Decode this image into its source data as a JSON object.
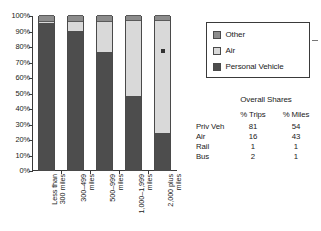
{
  "chart_data": {
    "type": "bar",
    "subtype": "stacked-bar-100-percent",
    "title": "",
    "xlabel": "",
    "ylabel": "",
    "ylim": [
      0,
      100
    ],
    "ytick_labels": [
      "100%",
      "90%",
      "80%",
      "70%",
      "60%",
      "50%",
      "40%",
      "30%",
      "20%",
      "10%",
      "0%"
    ],
    "ytick_values": [
      100,
      90,
      80,
      70,
      60,
      50,
      40,
      30,
      20,
      10,
      0
    ],
    "grid": false,
    "legend_position": "right",
    "categories": [
      "Less than\n300 miles",
      "300–499\nmiles",
      "500–999\nmiles",
      "1,000–1,999\nmiles",
      "2,000 plus\nmiles"
    ],
    "series": [
      {
        "name": "Personal Vehicle",
        "color": "#4d4d4d",
        "values": [
          95,
          90,
          76,
          48,
          24
        ]
      },
      {
        "name": "Air",
        "color": "#d9d9d9",
        "values": [
          1,
          6,
          20,
          49,
          73
        ]
      },
      {
        "name": "Other",
        "color": "#8c8c8c",
        "values": [
          4,
          4,
          4,
          3,
          3
        ]
      }
    ],
    "annotations": [
      {
        "name": "data-marker",
        "category": "2,000 plus miles",
        "value": 77
      }
    ]
  },
  "legend": {
    "items": [
      {
        "label": "Other",
        "color": "#8c8c8c"
      },
      {
        "label": "Air",
        "color": "#d9d9d9"
      },
      {
        "label": "Personal Vehicle",
        "color": "#4d4d4d"
      }
    ]
  },
  "shares": {
    "title": "Overall Shares",
    "columns": [
      "",
      "% Trips",
      "% Miles"
    ],
    "rows": [
      {
        "mode": "Priv Veh",
        "trips": "81",
        "miles": "54"
      },
      {
        "mode": "Air",
        "trips": "16",
        "miles": "43"
      },
      {
        "mode": "Rail",
        "trips": "1",
        "miles": "1"
      },
      {
        "mode": "Bus",
        "trips": "2",
        "miles": "1"
      }
    ]
  }
}
